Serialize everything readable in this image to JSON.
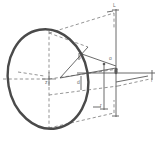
{
  "figure": {
    "title": "",
    "kind": "technical-line-drawing",
    "canvas": {
      "width": 161,
      "height": 146,
      "background": "#ffffff"
    },
    "colors": {
      "solid_line": "#5a5a5a",
      "dashed_line": "#7a7a7a",
      "disc_outline": "#4a4a4a",
      "label_text": "#6e6e6e",
      "background": "#ffffff"
    },
    "disc": {
      "name": "circular-disc",
      "center_x": 48,
      "center_y": 79,
      "radius_x": 40,
      "radius_y": 50,
      "rotation_deg": -10,
      "stroke_width": 2.2
    },
    "dimension_lines": [
      {
        "name": "top-right-vertical-dimension",
        "label": ""
      },
      {
        "name": "bottom-horizontal-dimension",
        "label": ""
      },
      {
        "name": "right-horizontal-axis",
        "label": ""
      },
      {
        "name": "center-vertical-dimension",
        "label": ""
      }
    ],
    "labels": [
      {
        "id": "label-top",
        "text": "L",
        "x": 113,
        "y": 5
      },
      {
        "id": "label-mid-left",
        "text": "l",
        "x": 80,
        "y": 57
      },
      {
        "id": "label-center",
        "text": "d",
        "x": 77,
        "y": 82
      },
      {
        "id": "label-node",
        "text": "o",
        "x": 109,
        "y": 58
      },
      {
        "id": "label-bottom",
        "text": "r",
        "x": 100,
        "y": 105
      },
      {
        "id": "label-right",
        "text": "l",
        "x": 151,
        "y": 80
      },
      {
        "id": "label-disc-center",
        "text": "z",
        "x": 45,
        "y": 82
      }
    ]
  }
}
